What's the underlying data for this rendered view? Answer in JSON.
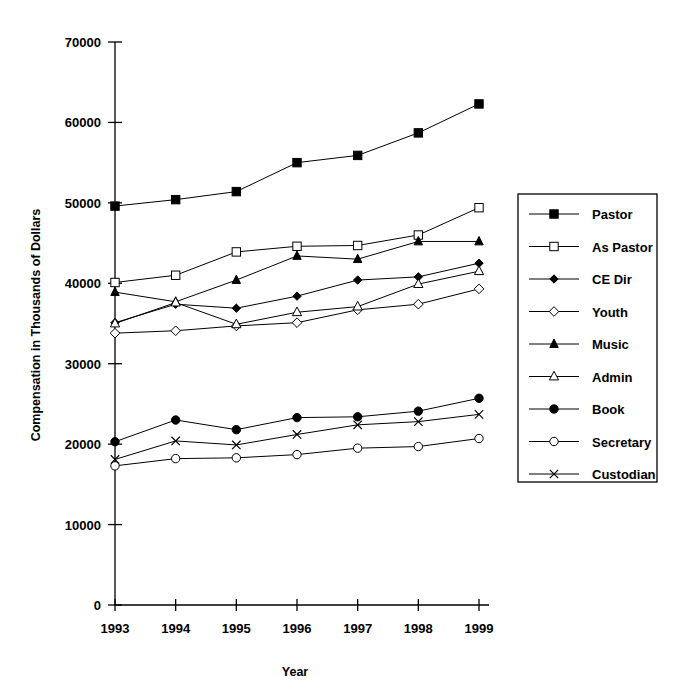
{
  "chart_data": {
    "type": "line",
    "title": "",
    "xlabel": "Year",
    "ylabel": "Compensation in Thousands of Dollars",
    "categories": [
      "1993",
      "1994",
      "1995",
      "1996",
      "1997",
      "1998",
      "1999"
    ],
    "x": [
      1993,
      1994,
      1995,
      1996,
      1997,
      1998,
      1999
    ],
    "xlim": [
      1993,
      1999
    ],
    "ylim": [
      0,
      70000
    ],
    "yticks": [
      "0",
      "10000",
      "20000",
      "30000",
      "40000",
      "50000",
      "60000",
      "70000"
    ],
    "ytick_values": [
      0,
      10000,
      20000,
      30000,
      40000,
      50000,
      60000,
      70000
    ],
    "grid": false,
    "legend_position": "right",
    "series": [
      {
        "name": "Pastor",
        "marker": "filled-square",
        "values": [
          49600,
          50400,
          51400,
          55000,
          55900,
          58700,
          62300
        ]
      },
      {
        "name": "As Pastor",
        "marker": "open-square",
        "values": [
          40100,
          41000,
          43900,
          44600,
          44700,
          46000,
          49400
        ]
      },
      {
        "name": "CE Dir",
        "marker": "filled-diamond",
        "values": [
          35100,
          37400,
          36900,
          38400,
          40400,
          40800,
          42500
        ]
      },
      {
        "name": "Youth",
        "marker": "open-diamond",
        "values": [
          33800,
          34100,
          34700,
          35100,
          36700,
          37400,
          39300
        ]
      },
      {
        "name": "Music",
        "marker": "filled-triangle",
        "values": [
          38900,
          37700,
          40400,
          43400,
          43000,
          45200,
          45200
        ]
      },
      {
        "name": "Admin",
        "marker": "open-triangle",
        "values": [
          35000,
          37600,
          34900,
          36400,
          37100,
          39900,
          41500
        ]
      },
      {
        "name": "Book",
        "marker": "filled-circle",
        "values": [
          20300,
          23000,
          21800,
          23300,
          23400,
          24100,
          25700
        ]
      },
      {
        "name": "Secretary",
        "marker": "open-circle",
        "values": [
          17300,
          18200,
          18300,
          18700,
          19500,
          19700,
          20700
        ]
      },
      {
        "name": "Custodian",
        "marker": "cross",
        "values": [
          18100,
          20400,
          19900,
          21200,
          22400,
          22800,
          23700
        ]
      }
    ]
  },
  "axes": {
    "x_title": "Year",
    "y_title": "Compensation in Thousands of Dollars"
  },
  "legend": {
    "items": [
      {
        "label": "Pastor",
        "marker": "filled-square"
      },
      {
        "label": "As Pastor",
        "marker": "open-square"
      },
      {
        "label": "CE Dir",
        "marker": "filled-diamond"
      },
      {
        "label": "Youth",
        "marker": "open-diamond"
      },
      {
        "label": "Music",
        "marker": "filled-triangle"
      },
      {
        "label": "Admin",
        "marker": "open-triangle"
      },
      {
        "label": "Book",
        "marker": "filled-circle"
      },
      {
        "label": "Secretary",
        "marker": "open-circle"
      },
      {
        "label": "Custodian",
        "marker": "cross"
      }
    ]
  },
  "colors": {
    "ink": "#000000",
    "background": "#ffffff"
  }
}
